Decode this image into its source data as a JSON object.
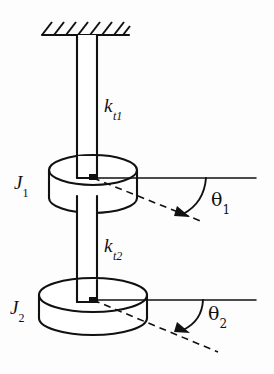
{
  "figure": {
    "background_color": "#fdfdfd",
    "line_color": "#111111",
    "width": 274,
    "height": 374
  },
  "labels": {
    "spring_1": {
      "symbol": "k",
      "subscript": "t1",
      "full": "kt1",
      "role": "torsional-stiffness-upper-shaft"
    },
    "spring_2": {
      "symbol": "k",
      "subscript": "t2",
      "full": "kt2",
      "role": "torsional-stiffness-lower-shaft"
    },
    "inertia_1": {
      "symbol": "J",
      "subscript": "1",
      "full": "J1",
      "role": "mass-moment-of-inertia-disk-1"
    },
    "inertia_2": {
      "symbol": "J",
      "subscript": "2",
      "full": "J2",
      "role": "mass-moment-of-inertia-disk-2"
    },
    "angle_1": {
      "symbol": "θ",
      "subscript": "1",
      "full": "θ1",
      "role": "angular-displacement-disk-1"
    },
    "angle_2": {
      "symbol": "θ",
      "subscript": "2",
      "full": "θ2",
      "role": "angular-displacement-disk-2"
    }
  },
  "components": {
    "fixed_support": {
      "name": "ceiling-hatched-support",
      "hatch_count": 7,
      "hatch_direction": "lower-left-to-upper-right"
    },
    "shaft_upper": {
      "name": "upper-shaft",
      "from": "fixed-support",
      "to": "disk-1"
    },
    "shaft_lower": {
      "name": "lower-shaft",
      "from": "disk-1",
      "to": "disk-2"
    },
    "disk_1": {
      "name": "disk-1-cylinder",
      "style": "isometric-cylinder",
      "relative_size": "smaller-diameter"
    },
    "disk_2": {
      "name": "disk-2-cylinder",
      "style": "isometric-cylinder",
      "relative_size": "larger-diameter"
    },
    "reference_line_1": {
      "name": "horizontal-reference-line-1",
      "style": "solid"
    },
    "reference_line_2": {
      "name": "horizontal-reference-line-2",
      "style": "solid"
    },
    "rotated_line_1": {
      "name": "rotated-radius-line-1",
      "style": "dashed",
      "arrow": "true"
    },
    "rotated_line_2": {
      "name": "rotated-radius-line-2",
      "style": "dashed",
      "arrow": "true"
    },
    "angle_arc_1": {
      "name": "angle-arc-1",
      "style": "solid-arc"
    },
    "angle_arc_2": {
      "name": "angle-arc-2",
      "style": "solid-arc"
    }
  }
}
